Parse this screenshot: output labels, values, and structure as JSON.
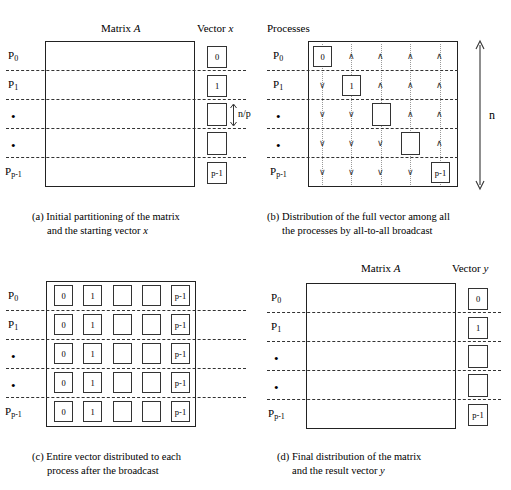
{
  "figure": {
    "panels": [
      {
        "id": "a",
        "heading_matrix": "Matrix",
        "heading_matrix_symbol": "A",
        "heading_vector": "Vector",
        "heading_vector_symbol": "x",
        "process_labels": [
          "P0",
          "P1",
          "•",
          "•",
          "Pp-1"
        ],
        "process_labels_base": [
          "P",
          "P",
          "•",
          "•",
          "P"
        ],
        "process_labels_sub": [
          "0",
          "1",
          "",
          "",
          "p-1"
        ],
        "vector_cells": [
          "0",
          "1",
          "",
          "",
          "p-1"
        ],
        "size_annotation": "n/p",
        "caption_tag": "(a)",
        "caption_line1": "Initial partitioning of the matrix",
        "caption_line2": "and the starting vector",
        "caption_italic": "x"
      },
      {
        "id": "b",
        "heading_processes": "Processes",
        "process_labels_base": [
          "P",
          "P",
          "•",
          "•",
          "P"
        ],
        "process_labels_sub": [
          "0",
          "1",
          "",
          "",
          "p-1"
        ],
        "diagonal_cells": [
          "0",
          "1",
          "",
          "",
          "p-1"
        ],
        "arrow_up_glyph": "∧",
        "arrow_down_glyph": "∨",
        "height_annotation": "n",
        "caption_tag": "(b)",
        "caption_line1": "Distribution of the full vector among all",
        "caption_line2": "the processes by all-to-all broadcast"
      },
      {
        "id": "c",
        "process_labels_base": [
          "P",
          "P",
          "•",
          "•",
          "P"
        ],
        "process_labels_sub": [
          "0",
          "1",
          "",
          "",
          "p-1"
        ],
        "grid_columns": [
          "0",
          "1",
          "",
          "",
          "p-1"
        ],
        "rows": 5,
        "caption_tag": "(c)",
        "caption_line1": "Entire vector distributed to each",
        "caption_line2": "process after the broadcast"
      },
      {
        "id": "d",
        "heading_matrix": "Matrix",
        "heading_matrix_symbol": "A",
        "heading_vector": "Vector",
        "heading_vector_symbol": "y",
        "process_labels_base": [
          "P",
          "P",
          "•",
          "•",
          "P"
        ],
        "process_labels_sub": [
          "0",
          "1",
          "",
          "",
          "p-1"
        ],
        "vector_cells": [
          "0",
          "1",
          "",
          "",
          "p-1"
        ],
        "caption_tag": "(d)",
        "caption_line1": "Final distribution of the matrix",
        "caption_line2": "and the result vector",
        "caption_italic": "y"
      }
    ],
    "colors": {
      "stroke": "#222222",
      "dashed": "#333333",
      "arrow": "#999999",
      "background": "#ffffff"
    }
  }
}
